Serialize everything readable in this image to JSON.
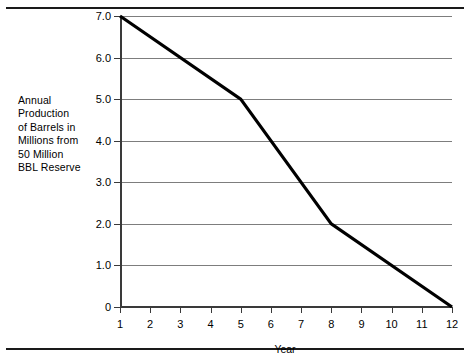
{
  "chart_data": {
    "type": "line",
    "title": "",
    "xlabel": "Year",
    "ylabel": "Annual Production of Barrels in Millions from 50 Million BBL Reserve",
    "ylabel_lines": [
      "Annual",
      "Production",
      "of Barrels in",
      "Millions from",
      "50 Million",
      "BBL Reserve"
    ],
    "x": [
      1,
      5,
      8,
      12
    ],
    "values": [
      7.0,
      5.0,
      2.0,
      0
    ],
    "series": [
      {
        "name": "Annual Production",
        "points": [
          {
            "x": 1,
            "y": 7.0
          },
          {
            "x": 5,
            "y": 5.0
          },
          {
            "x": 8,
            "y": 2.0
          },
          {
            "x": 12,
            "y": 0
          }
        ]
      }
    ],
    "xlim": [
      1,
      12
    ],
    "ylim": [
      0,
      7
    ],
    "xticks": [
      1,
      2,
      3,
      4,
      5,
      6,
      7,
      8,
      9,
      10,
      11,
      12
    ],
    "xticklabels": [
      "1",
      "2",
      "3",
      "4",
      "5",
      "6",
      "7",
      "8",
      "9",
      "10",
      "11",
      "12"
    ],
    "yticks": [
      0,
      1,
      2,
      3,
      4,
      5,
      6,
      7
    ],
    "yticklabels": [
      "0",
      "1.0",
      "2.0",
      "3.0",
      "4.0",
      "5.0",
      "6.0",
      "7.0"
    ],
    "grid": "horizontal",
    "legend": "none",
    "line_color": "#000000",
    "grid_color": "#7d7d7d",
    "axis_color": "#3a3a3a",
    "rule_color": "#1a1a1a"
  }
}
